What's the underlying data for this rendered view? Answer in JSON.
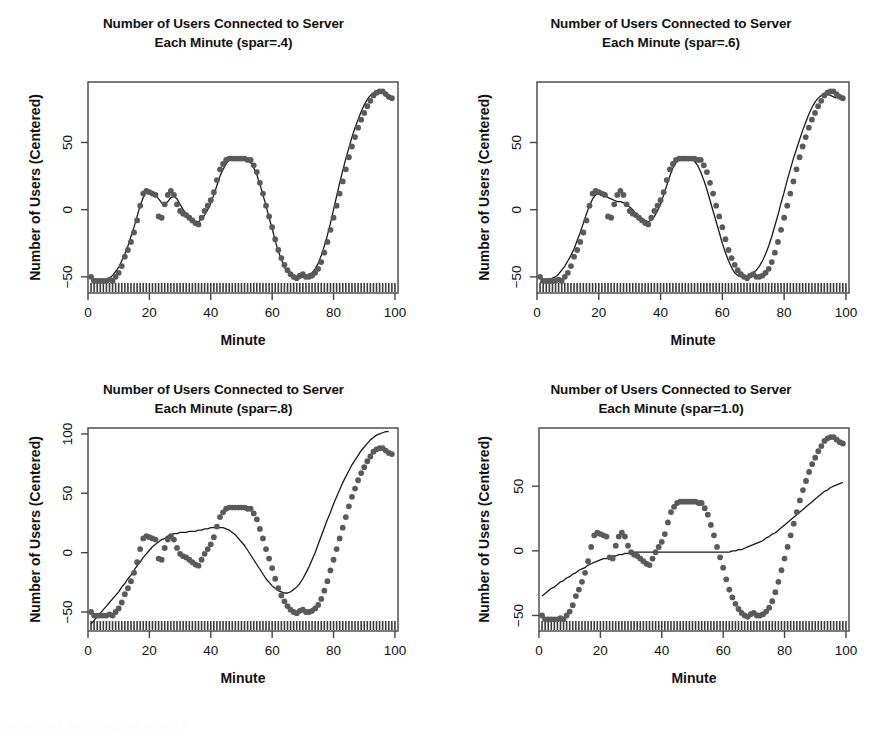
{
  "figure": {
    "background": "#ffffff",
    "point_color": "#5a5a5a",
    "line_color": "#1a1a1a",
    "axis_color": "#444444",
    "panels": [
      {
        "id": "spar-04",
        "title_line1": "Number of Users Connected to Server",
        "title_line2": "Each Minute (spar=.4)",
        "chart_ref": 0
      },
      {
        "id": "spar-06",
        "title_line1": "Number of Users Connected to Server",
        "title_line2": "Each Minute (spar=.6)",
        "chart_ref": 1
      },
      {
        "id": "spar-08",
        "title_line1": "Number of Users Connected to Server",
        "title_line2": "Each Minute (spar=.8)",
        "chart_ref": 2
      },
      {
        "id": "spar-10",
        "title_line1": "Number of Users Connected to Server",
        "title_line2": "Each Minute (spar=1.0)",
        "chart_ref": 3
      }
    ]
  },
  "bottom_text": "the different smoothing parameters",
  "chart_data": [
    {
      "type": "scatter",
      "title": "Number of Users Connected to Server Each Minute (spar=.4)",
      "xlabel": "Minute",
      "ylabel": "Number of Users (Centered)",
      "xlim": [
        0,
        101
      ],
      "ylim": [
        -62,
        95
      ],
      "xticks": [
        0,
        20,
        40,
        60,
        80,
        100
      ],
      "yticks": [
        -50,
        0,
        50
      ],
      "grid": false,
      "legend": "none",
      "rug": true,
      "smoother": "smoothing spline, spar=0.4",
      "x": [
        1,
        2,
        3,
        4,
        5,
        6,
        7,
        8,
        9,
        10,
        11,
        12,
        13,
        14,
        15,
        16,
        17,
        18,
        19,
        20,
        21,
        22,
        23,
        24,
        25,
        26,
        27,
        28,
        29,
        30,
        31,
        32,
        33,
        34,
        35,
        36,
        37,
        38,
        39,
        40,
        41,
        42,
        43,
        44,
        45,
        46,
        47,
        48,
        49,
        50,
        51,
        52,
        53,
        54,
        55,
        56,
        57,
        58,
        59,
        60,
        61,
        62,
        63,
        64,
        65,
        66,
        67,
        68,
        69,
        70,
        71,
        72,
        73,
        74,
        75,
        76,
        77,
        78,
        79,
        80,
        81,
        82,
        83,
        84,
        85,
        86,
        87,
        88,
        89,
        90,
        91,
        92,
        93,
        94,
        95,
        96,
        97,
        98,
        99,
        100
      ],
      "y": [
        -50,
        -53,
        -53,
        -53,
        -53,
        -53,
        -52,
        -53,
        -50,
        -47,
        -42,
        -35,
        -30,
        -24,
        -17,
        -8,
        3,
        12,
        14,
        13,
        12,
        11,
        -5,
        -6,
        4,
        11,
        14,
        11,
        4,
        -1,
        -3,
        -4,
        -6,
        -8,
        -10,
        -11,
        -6,
        -1,
        3,
        7,
        13,
        22,
        30,
        34,
        37,
        38,
        38,
        38,
        38,
        38,
        38,
        37,
        37,
        33,
        28,
        20,
        12,
        3,
        -5,
        -13,
        -22,
        -30,
        -36,
        -41,
        -45,
        -48,
        -50,
        -51,
        -49,
        -48,
        -50,
        -50,
        -49,
        -47,
        -44,
        -39,
        -32,
        -24,
        -15,
        -6,
        3,
        12,
        21,
        30,
        39,
        47,
        54,
        61,
        67,
        72,
        77,
        81,
        85,
        87,
        88,
        88,
        86,
        84,
        83
      ],
      "smooth_y": [
        -53,
        -53,
        -53,
        -53,
        -53,
        -52,
        -51,
        -49,
        -46,
        -43,
        -38,
        -33,
        -27,
        -20,
        -13,
        -5,
        3,
        9,
        13,
        14,
        13,
        11,
        8,
        5,
        4,
        6,
        9,
        10,
        8,
        4,
        0,
        -3,
        -6,
        -8,
        -9,
        -9,
        -7,
        -4,
        0,
        5,
        11,
        18,
        25,
        30,
        34,
        37,
        38,
        38,
        38,
        38,
        38,
        37,
        35,
        31,
        26,
        19,
        11,
        3,
        -6,
        -14,
        -23,
        -31,
        -37,
        -43,
        -46,
        -49,
        -50,
        -51,
        -51,
        -50,
        -49,
        -48,
        -47,
        -44,
        -40,
        -34,
        -27,
        -19,
        -10,
        0,
        10,
        20,
        29,
        38,
        46,
        54,
        61,
        67,
        73,
        78,
        82,
        85,
        87,
        88,
        88,
        87,
        85,
        84
      ]
    },
    {
      "type": "scatter",
      "title": "Number of Users Connected to Server Each Minute (spar=.6)",
      "xlabel": "Minute",
      "ylabel": "Number of Users (Centered)",
      "xlim": [
        0,
        101
      ],
      "ylim": [
        -62,
        95
      ],
      "xticks": [
        0,
        20,
        40,
        60,
        80,
        100
      ],
      "yticks": [
        -50,
        0,
        50
      ],
      "grid": false,
      "legend": "none",
      "rug": true,
      "smoother": "smoothing spline, spar=0.6",
      "x": [
        1,
        2,
        3,
        4,
        5,
        6,
        7,
        8,
        9,
        10,
        11,
        12,
        13,
        14,
        15,
        16,
        17,
        18,
        19,
        20,
        21,
        22,
        23,
        24,
        25,
        26,
        27,
        28,
        29,
        30,
        31,
        32,
        33,
        34,
        35,
        36,
        37,
        38,
        39,
        40,
        41,
        42,
        43,
        44,
        45,
        46,
        47,
        48,
        49,
        50,
        51,
        52,
        53,
        54,
        55,
        56,
        57,
        58,
        59,
        60,
        61,
        62,
        63,
        64,
        65,
        66,
        67,
        68,
        69,
        70,
        71,
        72,
        73,
        74,
        75,
        76,
        77,
        78,
        79,
        80,
        81,
        82,
        83,
        84,
        85,
        86,
        87,
        88,
        89,
        90,
        91,
        92,
        93,
        94,
        95,
        96,
        97,
        98,
        99,
        100
      ],
      "y": [
        -50,
        -53,
        -53,
        -53,
        -53,
        -53,
        -52,
        -53,
        -50,
        -47,
        -42,
        -35,
        -30,
        -24,
        -17,
        -8,
        3,
        12,
        14,
        13,
        12,
        11,
        -5,
        -6,
        4,
        11,
        14,
        11,
        4,
        -1,
        -3,
        -4,
        -6,
        -8,
        -10,
        -11,
        -6,
        -1,
        3,
        7,
        13,
        22,
        30,
        34,
        37,
        38,
        38,
        38,
        38,
        38,
        38,
        37,
        37,
        33,
        28,
        20,
        12,
        3,
        -5,
        -13,
        -22,
        -30,
        -36,
        -41,
        -45,
        -48,
        -50,
        -51,
        -49,
        -48,
        -50,
        -50,
        -49,
        -47,
        -44,
        -39,
        -32,
        -24,
        -15,
        -6,
        3,
        12,
        21,
        30,
        39,
        47,
        54,
        61,
        67,
        72,
        77,
        81,
        85,
        87,
        88,
        88,
        86,
        84,
        83
      ],
      "smooth_y": [
        -54,
        -54,
        -53,
        -52,
        -51,
        -50,
        -48,
        -45,
        -42,
        -38,
        -34,
        -29,
        -23,
        -17,
        -10,
        -3,
        3,
        8,
        11,
        12,
        12,
        11,
        9,
        8,
        7,
        6,
        6,
        5,
        4,
        2,
        0,
        -3,
        -5,
        -7,
        -8,
        -9,
        -8,
        -5,
        -1,
        4,
        11,
        18,
        25,
        31,
        35,
        38,
        39,
        39,
        39,
        38,
        36,
        33,
        28,
        22,
        15,
        7,
        -1,
        -9,
        -17,
        -25,
        -32,
        -38,
        -43,
        -47,
        -49,
        -50,
        -50,
        -50,
        -49,
        -47,
        -45,
        -42,
        -38,
        -33,
        -27,
        -20,
        -12,
        -4,
        5,
        13,
        22,
        30,
        38,
        45,
        52,
        59,
        65,
        71,
        76,
        80,
        83,
        85,
        86,
        86,
        85,
        84,
        83
      ]
    },
    {
      "type": "scatter",
      "title": "Number of Users Connected to Server Each Minute (spar=.8)",
      "xlabel": "Minute",
      "ylabel": "Number of Users (Centered)",
      "xlim": [
        0,
        101
      ],
      "ylim": [
        -66,
        105
      ],
      "xticks": [
        0,
        20,
        40,
        60,
        80,
        100
      ],
      "yticks": [
        -50,
        0,
        50,
        100
      ],
      "grid": false,
      "legend": "none",
      "rug": true,
      "smoother": "smoothing spline, spar=0.8",
      "x": [
        1,
        2,
        3,
        4,
        5,
        6,
        7,
        8,
        9,
        10,
        11,
        12,
        13,
        14,
        15,
        16,
        17,
        18,
        19,
        20,
        21,
        22,
        23,
        24,
        25,
        26,
        27,
        28,
        29,
        30,
        31,
        32,
        33,
        34,
        35,
        36,
        37,
        38,
        39,
        40,
        41,
        42,
        43,
        44,
        45,
        46,
        47,
        48,
        49,
        50,
        51,
        52,
        53,
        54,
        55,
        56,
        57,
        58,
        59,
        60,
        61,
        62,
        63,
        64,
        65,
        66,
        67,
        68,
        69,
        70,
        71,
        72,
        73,
        74,
        75,
        76,
        77,
        78,
        79,
        80,
        81,
        82,
        83,
        84,
        85,
        86,
        87,
        88,
        89,
        90,
        91,
        92,
        93,
        94,
        95,
        96,
        97,
        98,
        99,
        100
      ],
      "y": [
        -50,
        -53,
        -53,
        -53,
        -53,
        -53,
        -52,
        -53,
        -50,
        -47,
        -42,
        -35,
        -30,
        -24,
        -17,
        -8,
        3,
        12,
        14,
        13,
        12,
        11,
        -5,
        -6,
        4,
        11,
        14,
        11,
        4,
        -1,
        -3,
        -4,
        -6,
        -8,
        -10,
        -11,
        -6,
        -1,
        3,
        7,
        13,
        22,
        30,
        34,
        37,
        38,
        38,
        38,
        38,
        38,
        38,
        37,
        37,
        33,
        28,
        20,
        12,
        3,
        -5,
        -13,
        -22,
        -30,
        -36,
        -41,
        -45,
        -48,
        -50,
        -51,
        -49,
        -48,
        -50,
        -50,
        -49,
        -47,
        -44,
        -39,
        -32,
        -24,
        -15,
        -6,
        3,
        12,
        21,
        30,
        39,
        47,
        54,
        61,
        67,
        72,
        77,
        81,
        85,
        87,
        88,
        88,
        86,
        84,
        83
      ],
      "smooth_y": [
        -60,
        -57,
        -54,
        -51,
        -48,
        -45,
        -42,
        -39,
        -36,
        -33,
        -29,
        -26,
        -22,
        -19,
        -15,
        -11,
        -8,
        -4,
        -1,
        2,
        5,
        7,
        9,
        11,
        12,
        14,
        15,
        16,
        16,
        17,
        17,
        17,
        18,
        18,
        18,
        19,
        19,
        20,
        20,
        21,
        21,
        21,
        21,
        21,
        20,
        19,
        17,
        15,
        12,
        9,
        6,
        2,
        -2,
        -6,
        -10,
        -14,
        -18,
        -22,
        -25,
        -28,
        -30,
        -32,
        -33,
        -34,
        -34,
        -33,
        -31,
        -29,
        -26,
        -22,
        -17,
        -12,
        -6,
        0,
        7,
        14,
        21,
        28,
        34,
        41,
        47,
        53,
        59,
        64,
        69,
        74,
        78,
        82,
        86,
        89,
        92,
        95,
        97,
        99,
        100,
        101,
        102,
        102
      ]
    },
    {
      "type": "scatter",
      "title": "Number of Users Connected to Server Each Minute (spar=1.0)",
      "xlabel": "Minute",
      "ylabel": "Number of Users (Centered)",
      "xlim": [
        0,
        101
      ],
      "ylim": [
        -62,
        95
      ],
      "xticks": [
        0,
        20,
        40,
        60,
        80,
        100
      ],
      "yticks": [
        -50,
        0,
        50
      ],
      "grid": false,
      "legend": "none",
      "rug": true,
      "smoother": "smoothing spline, spar=1.0",
      "x": [
        1,
        2,
        3,
        4,
        5,
        6,
        7,
        8,
        9,
        10,
        11,
        12,
        13,
        14,
        15,
        16,
        17,
        18,
        19,
        20,
        21,
        22,
        23,
        24,
        25,
        26,
        27,
        28,
        29,
        30,
        31,
        32,
        33,
        34,
        35,
        36,
        37,
        38,
        39,
        40,
        41,
        42,
        43,
        44,
        45,
        46,
        47,
        48,
        49,
        50,
        51,
        52,
        53,
        54,
        55,
        56,
        57,
        58,
        59,
        60,
        61,
        62,
        63,
        64,
        65,
        66,
        67,
        68,
        69,
        70,
        71,
        72,
        73,
        74,
        75,
        76,
        77,
        78,
        79,
        80,
        81,
        82,
        83,
        84,
        85,
        86,
        87,
        88,
        89,
        90,
        91,
        92,
        93,
        94,
        95,
        96,
        97,
        98,
        99,
        100
      ],
      "y": [
        -50,
        -53,
        -53,
        -53,
        -53,
        -53,
        -52,
        -53,
        -50,
        -47,
        -42,
        -35,
        -30,
        -24,
        -17,
        -8,
        3,
        12,
        14,
        13,
        12,
        11,
        -5,
        -6,
        4,
        11,
        14,
        11,
        4,
        -1,
        -3,
        -4,
        -6,
        -8,
        -10,
        -11,
        -6,
        -1,
        3,
        7,
        13,
        22,
        30,
        34,
        37,
        38,
        38,
        38,
        38,
        38,
        38,
        37,
        37,
        33,
        28,
        20,
        12,
        3,
        -5,
        -13,
        -22,
        -30,
        -36,
        -41,
        -45,
        -48,
        -50,
        -51,
        -49,
        -48,
        -50,
        -50,
        -49,
        -47,
        -44,
        -39,
        -32,
        -24,
        -15,
        -6,
        3,
        12,
        21,
        30,
        39,
        47,
        54,
        61,
        67,
        72,
        77,
        81,
        85,
        87,
        88,
        88,
        86,
        84,
        83
      ],
      "smooth_y": [
        -35,
        -33,
        -31,
        -29,
        -28,
        -26,
        -24,
        -23,
        -21,
        -20,
        -18,
        -17,
        -15,
        -14,
        -13,
        -11,
        -10,
        -9,
        -8,
        -7,
        -6,
        -6,
        -5,
        -4,
        -4,
        -3,
        -3,
        -2,
        -2,
        -2,
        -1,
        -1,
        -1,
        -1,
        -1,
        -1,
        -1,
        -1,
        -1,
        -1,
        -1,
        -1,
        -1,
        -1,
        -1,
        -1,
        -1,
        -1,
        -1,
        -1,
        -1,
        -1,
        -1,
        -1,
        -1,
        -1,
        -1,
        -1,
        -1,
        -1,
        -1,
        -1,
        0,
        0,
        1,
        1,
        2,
        3,
        4,
        5,
        6,
        7,
        8,
        10,
        11,
        13,
        14,
        16,
        18,
        20,
        22,
        24,
        26,
        28,
        30,
        32,
        34,
        36,
        38,
        40,
        42,
        44,
        46,
        47,
        49,
        50,
        51,
        52,
        53
      ]
    }
  ]
}
